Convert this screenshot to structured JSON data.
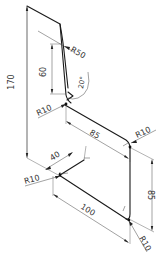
{
  "drawing": {
    "type": "isometric dimensioned sketch",
    "colors": {
      "line": "#1a1a1a",
      "dimension": "#444444",
      "text": "#333333",
      "background": "#ffffff"
    },
    "dimensions": {
      "overall_height": "170",
      "upper_vertical": "60",
      "top_radius": "R50",
      "angle": "20°",
      "upper_bend_radius": "R10",
      "upper_horizontal": "85",
      "right_bend_radius": "R10",
      "right_vertical": "85",
      "lower_left_length": "40",
      "lower_left_radius": "R10",
      "bottom_length": "100",
      "bottom_right_radius": "R10"
    }
  }
}
